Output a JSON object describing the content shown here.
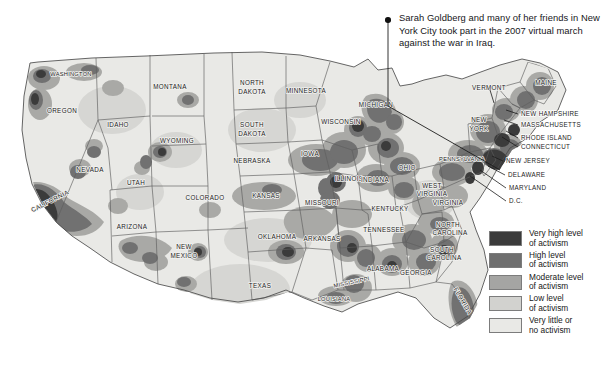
{
  "figure": {
    "type": "choropleth-map",
    "region": "United States",
    "background_color": "#ffffff"
  },
  "callout": {
    "marker": "callout-dot",
    "text": "Sarah Goldberg and many of her friends in New York City took part in the 2007 virtual march against the war in Iraq."
  },
  "legend": {
    "items": [
      {
        "label": "Very high level\nof activism",
        "color": "#3b3b3b"
      },
      {
        "label": "High level\nof activism",
        "color": "#6f6f6f"
      },
      {
        "label": "Moderate level\nof activism",
        "color": "#a5a5a3"
      },
      {
        "label": "Low level\nof activism",
        "color": "#d2d2cf"
      },
      {
        "label": "Very little or\nno activism",
        "color": "#e9e9e6"
      }
    ]
  },
  "map": {
    "base_fill": "#e9e9e6",
    "border_color": "#5b5b5b",
    "state_labels": [
      {
        "name": "WASHINGTON",
        "x": 71,
        "y": 76
      },
      {
        "name": "OREGON",
        "x": 62,
        "y": 113
      },
      {
        "name": "IDAHO",
        "x": 118,
        "y": 127
      },
      {
        "name": "MONTANA",
        "x": 170,
        "y": 89
      },
      {
        "name": "WYOMING",
        "x": 177,
        "y": 143
      },
      {
        "name": "NEVADA",
        "x": 90,
        "y": 172
      },
      {
        "name": "UTAH",
        "x": 136,
        "y": 185
      },
      {
        "name": "CALIFORNIA",
        "x": 51,
        "y": 203
      },
      {
        "name": "ARIZONA",
        "x": 132,
        "y": 229
      },
      {
        "name": "NEW",
        "x": 184,
        "y": 249
      },
      {
        "name": "MEXICO",
        "x": 184,
        "y": 258
      },
      {
        "name": "COLORADO",
        "x": 205,
        "y": 200
      },
      {
        "name": "NORTH",
        "x": 252,
        "y": 85
      },
      {
        "name": "DAKOTA",
        "x": 252,
        "y": 94
      },
      {
        "name": "SOUTH",
        "x": 252,
        "y": 127
      },
      {
        "name": "DAKOTA",
        "x": 252,
        "y": 136
      },
      {
        "name": "NEBRASKA",
        "x": 252,
        "y": 163
      },
      {
        "name": "KANSAS",
        "x": 266,
        "y": 198
      },
      {
        "name": "OKLAHOMA",
        "x": 277,
        "y": 239
      },
      {
        "name": "TEXAS",
        "x": 260,
        "y": 288
      },
      {
        "name": "MINNESOTA",
        "x": 306,
        "y": 93
      },
      {
        "name": "IOWA",
        "x": 310,
        "y": 156
      },
      {
        "name": "MISSOURI",
        "x": 322,
        "y": 205
      },
      {
        "name": "ARKANSAS",
        "x": 322,
        "y": 241
      },
      {
        "name": "LOUISIANA",
        "x": 334,
        "y": 299
      },
      {
        "name": "MISSISSIPPI",
        "x": 352,
        "y": 282
      },
      {
        "name": "WISCONSIN",
        "x": 341,
        "y": 124
      },
      {
        "name": "ILLINOIS",
        "x": 349,
        "y": 181
      },
      {
        "name": "INDIANA",
        "x": 375,
        "y": 182
      },
      {
        "name": "MICHIGAN",
        "x": 376,
        "y": 107
      },
      {
        "name": "OHIO",
        "x": 407,
        "y": 170
      },
      {
        "name": "KENTUCKY",
        "x": 390,
        "y": 211
      },
      {
        "name": "TENNESSEE",
        "x": 384,
        "y": 232
      },
      {
        "name": "ALABAMA",
        "x": 383,
        "y": 271
      },
      {
        "name": "GEORGIA",
        "x": 416,
        "y": 275
      },
      {
        "name": "FLORIDA",
        "x": 458,
        "y": 303
      },
      {
        "name": "SOUTH",
        "x": 442,
        "y": 252
      },
      {
        "name": "CAROLINA",
        "x": 444,
        "y": 260
      },
      {
        "name": "NORTH",
        "x": 448,
        "y": 227
      },
      {
        "name": "CAROLINA",
        "x": 450,
        "y": 235
      },
      {
        "name": "VIRGINIA",
        "x": 448,
        "y": 205
      },
      {
        "name": "WEST",
        "x": 432,
        "y": 188
      },
      {
        "name": "VIRGINIA",
        "x": 432,
        "y": 196
      },
      {
        "name": "PENNSYLVANIA",
        "x": 462,
        "y": 160
      },
      {
        "name": "NEW",
        "x": 479,
        "y": 122
      },
      {
        "name": "YORK",
        "x": 479,
        "y": 131
      },
      {
        "name": "VERMONT",
        "x": 489,
        "y": 90
      },
      {
        "name": "MAINE",
        "x": 546,
        "y": 85
      }
    ],
    "leader_labels": [
      {
        "name": "NEW HAMPSHIRE",
        "x": 521,
        "y": 116
      },
      {
        "name": "MASSACHUSETTS",
        "x": 521,
        "y": 127
      },
      {
        "name": "RHODE ISLAND",
        "x": 521,
        "y": 140
      },
      {
        "name": "CONNECTICUT",
        "x": 521,
        "y": 149
      },
      {
        "name": "NEW JERSEY",
        "x": 506,
        "y": 163
      },
      {
        "name": "DELAWARE",
        "x": 508,
        "y": 177
      },
      {
        "name": "MARYLAND",
        "x": 509,
        "y": 190
      },
      {
        "name": "D.C.",
        "x": 509,
        "y": 203
      }
    ]
  }
}
